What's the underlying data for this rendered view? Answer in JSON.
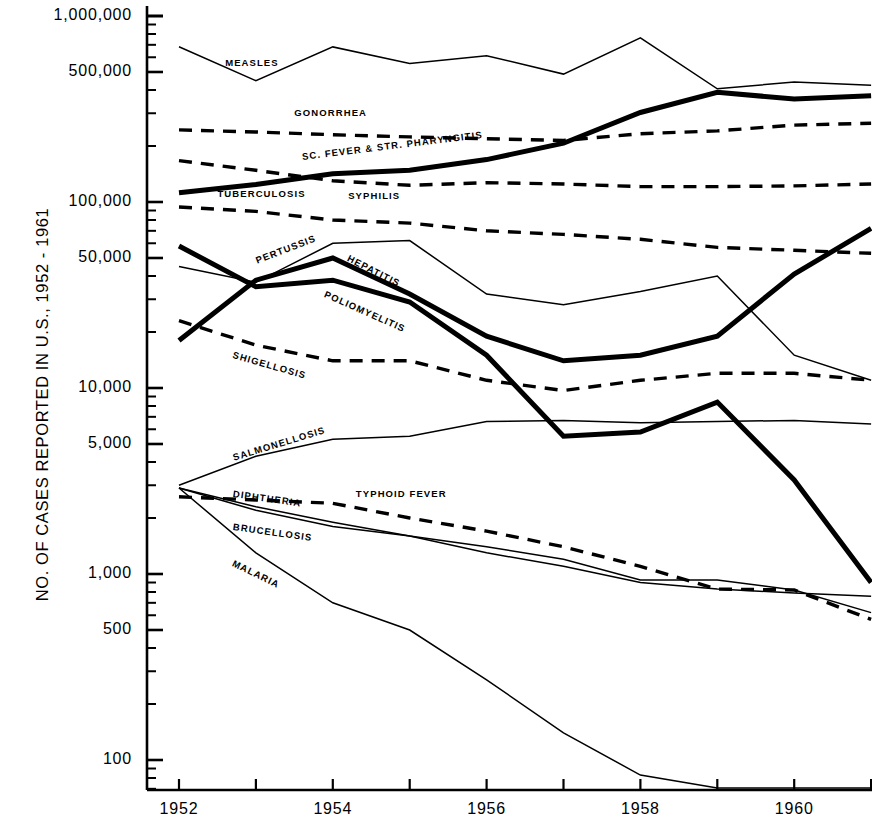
{
  "axes": {
    "ylabel": "NO. OF CASES REPORTED IN U.S., 1952 - 1961",
    "ytick_labels": [
      "1,000,000",
      "500,000",
      "100,000",
      "50,000",
      "10,000",
      "5,000",
      "1,000",
      "500",
      "100"
    ],
    "xtick_labels": [
      "1952",
      "1954",
      "1956",
      "1958",
      "1960"
    ]
  },
  "chart_data": {
    "type": "line",
    "title": "",
    "xlabel": "",
    "ylabel": "NO. OF CASES REPORTED IN U.S., 1952 - 1961",
    "yscale": "log",
    "ylim": [
      60,
      1200000
    ],
    "xlim": [
      1952,
      1961
    ],
    "grid": false,
    "legend": "inline-labels",
    "x": [
      1952,
      1953,
      1954,
      1955,
      1956,
      1957,
      1958,
      1959,
      1960,
      1961
    ],
    "ytick_values": [
      1000000,
      500000,
      100000,
      50000,
      10000,
      5000,
      1000,
      500,
      100
    ],
    "xtick_values": [
      1952,
      1953,
      1954,
      1956,
      1958,
      1960
    ],
    "series": [
      {
        "name": "MEASLES",
        "style": "thin-solid",
        "values": [
          683000,
          449000,
          682000,
          555000,
          612000,
          487000,
          763000,
          406000,
          442000,
          424000
        ]
      },
      {
        "name": "GONORRHEA",
        "style": "dashed",
        "values": [
          244000,
          238000,
          230000,
          224000,
          219000,
          214000,
          233000,
          241000,
          259000,
          265000
        ]
      },
      {
        "name": "SC. FEVER & STR. PHARYNGITIS",
        "style": "thick-solid",
        "values": [
          112000,
          124000,
          142000,
          148000,
          169000,
          207000,
          303000,
          389000,
          358000,
          373000
        ]
      },
      {
        "name": "SYPHILIS",
        "style": "dashed",
        "values": [
          167000,
          148000,
          130000,
          123000,
          127000,
          125000,
          121000,
          121000,
          122000,
          125000
        ]
      },
      {
        "name": "TUBERCULOSIS",
        "style": "dashed",
        "values": [
          94000,
          89000,
          80000,
          77000,
          70000,
          67000,
          63000,
          57000,
          55000,
          53000
        ]
      },
      {
        "name": "PERTUSSIS",
        "style": "thin-solid",
        "values": [
          45000,
          37000,
          60000,
          62000,
          32000,
          28000,
          33000,
          40000,
          15000,
          11000
        ]
      },
      {
        "name": "HEPATITIS",
        "style": "thick-solid",
        "values": [
          18000,
          38000,
          50000,
          32000,
          19000,
          14000,
          15000,
          19000,
          41000,
          72000
        ]
      },
      {
        "name": "POLIOMYELITIS",
        "style": "thick-solid",
        "values": [
          58000,
          35000,
          38000,
          29000,
          15000,
          5500,
          5800,
          8400,
          3200,
          900
        ]
      },
      {
        "name": "SHIGELLOSIS",
        "style": "dashed",
        "values": [
          23000,
          17000,
          14000,
          14000,
          11000,
          9700,
          11000,
          12000,
          12000,
          11000
        ]
      },
      {
        "name": "SALMONELLOSIS",
        "style": "thin-solid",
        "values": [
          3000,
          4300,
          5300,
          5500,
          6600,
          6700,
          6500,
          6600,
          6700,
          6400
        ]
      },
      {
        "name": "DIPHTHERIA",
        "style": "thin-solid",
        "values": [
          2900,
          2300,
          1900,
          1600,
          1400,
          1200,
          930,
          930,
          820,
          620
        ]
      },
      {
        "name": "TYPHOID FEVER",
        "style": "dashed",
        "values": [
          2600,
          2500,
          2400,
          2000,
          1700,
          1400,
          1100,
          830,
          820,
          570
        ]
      },
      {
        "name": "BRUCELLOSIS",
        "style": "thin-solid",
        "values": [
          2900,
          2200,
          1800,
          1600,
          1300,
          1100,
          900,
          830,
          790,
          760
        ]
      },
      {
        "name": "MALARIA",
        "style": "thin-solid",
        "values": [
          2900,
          1300,
          700,
          500,
          270,
          140,
          83,
          68,
          68,
          68
        ]
      }
    ],
    "annotations": [
      {
        "text": "MEASLES",
        "x": 1952.6,
        "y": 560000
      },
      {
        "text": "GONORRHEA",
        "x": 1953.5,
        "y": 300000
      },
      {
        "text": "SC. FEVER & STR. PHARYNGITIS",
        "x": 1953.6,
        "y": 175000
      },
      {
        "text": "SYPHILIS",
        "x": 1954.2,
        "y": 108000
      },
      {
        "text": "TUBERCULOSIS",
        "x": 1952.5,
        "y": 110000
      },
      {
        "text": "PERTUSSIS",
        "x": 1953.0,
        "y": 48000
      },
      {
        "text": "HEPATITIS",
        "x": 1954.2,
        "y": 50000
      },
      {
        "text": "POLIOMYELITIS",
        "x": 1953.9,
        "y": 32000
      },
      {
        "text": "SHIGELLOSIS",
        "x": 1952.7,
        "y": 15000
      },
      {
        "text": "SALMONELLOSIS",
        "x": 1952.7,
        "y": 4200
      },
      {
        "text": "DIPHTHERIA",
        "x": 1952.7,
        "y": 2700
      },
      {
        "text": "TYPHOID FEVER",
        "x": 1954.3,
        "y": 2700
      },
      {
        "text": "BRUCELLOSIS",
        "x": 1952.7,
        "y": 1800
      },
      {
        "text": "MALARIA",
        "x": 1952.7,
        "y": 1150
      }
    ]
  }
}
